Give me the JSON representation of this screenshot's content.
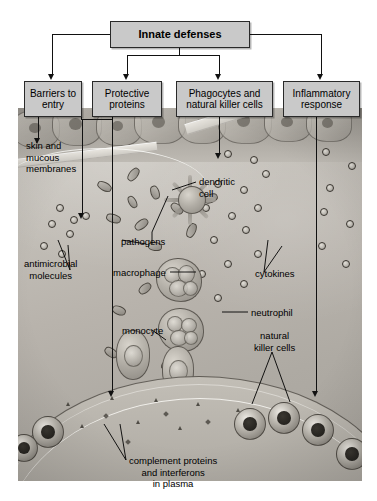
{
  "diagram": {
    "title_box": {
      "label": "Innate defenses"
    },
    "categories": [
      {
        "id": "barriers",
        "label": "Barriers\nto entry"
      },
      {
        "id": "proteins",
        "label": "Protective\nproteins"
      },
      {
        "id": "phagocytes",
        "label": "Phagocytes and\nnatural killer cells"
      },
      {
        "id": "inflammatory",
        "label": "Inflammatory\nresponse"
      }
    ],
    "photo_labels": [
      {
        "id": "skin",
        "text": "skin and\nmucous\nmembranes"
      },
      {
        "id": "antimicrobial",
        "text": "antimicrobial\nmolecules"
      },
      {
        "id": "dendritic",
        "text": "dendritic\ncell"
      },
      {
        "id": "pathogens",
        "text": "pathogens"
      },
      {
        "id": "macrophage",
        "text": "macrophage"
      },
      {
        "id": "monocyte",
        "text": "monocyte"
      },
      {
        "id": "cytokines",
        "text": "cytokines"
      },
      {
        "id": "neutrophil",
        "text": "neutrophil"
      },
      {
        "id": "natural-killer",
        "text": "natural\nkiller cells"
      },
      {
        "id": "complement",
        "text": "complement proteins\nand interferons\nin plasma"
      }
    ],
    "colors": {
      "box_fill": "#c9c9c9",
      "box_border": "#2a2a2a",
      "line": "#111111",
      "photo_bg": "#b9b5ae",
      "text": "#000000"
    }
  }
}
